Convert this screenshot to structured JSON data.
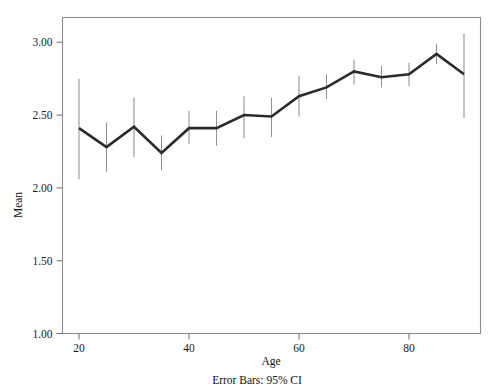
{
  "chart_data": {
    "type": "line",
    "title": "",
    "xlabel": "Age",
    "ylabel": "Mean",
    "footnote": "Error Bars: 95% CI",
    "x": [
      20,
      25,
      30,
      35,
      40,
      45,
      50,
      55,
      60,
      65,
      70,
      75,
      80,
      85,
      90
    ],
    "values": [
      2.41,
      2.28,
      2.42,
      2.24,
      2.41,
      2.41,
      2.5,
      2.49,
      2.63,
      2.69,
      2.8,
      2.76,
      2.78,
      2.92,
      2.78
    ],
    "ci_lower": [
      2.06,
      2.11,
      2.21,
      2.12,
      2.3,
      2.29,
      2.34,
      2.35,
      2.49,
      2.61,
      2.71,
      2.69,
      2.7,
      2.85,
      2.48
    ],
    "ci_upper": [
      2.75,
      2.45,
      2.62,
      2.36,
      2.53,
      2.53,
      2.63,
      2.62,
      2.77,
      2.78,
      2.88,
      2.84,
      2.86,
      2.99,
      3.06
    ],
    "xlim": [
      17,
      93
    ],
    "ylim": [
      1.0,
      3.17
    ],
    "xticks": [
      20,
      40,
      60,
      80
    ],
    "xtick_labels": [
      "20",
      "40",
      "60",
      "80"
    ],
    "yticks": [
      1.0,
      1.5,
      2.0,
      2.5,
      3.0
    ],
    "ytick_labels": [
      "1.00",
      "1.50",
      "2.00",
      "2.50",
      "3.00"
    ],
    "grid": false,
    "legend": "none",
    "line_color": "#2b2b2b",
    "error_bar_color": "#909090",
    "frame_color": "#8d8d8d",
    "background": "#ffffff"
  }
}
